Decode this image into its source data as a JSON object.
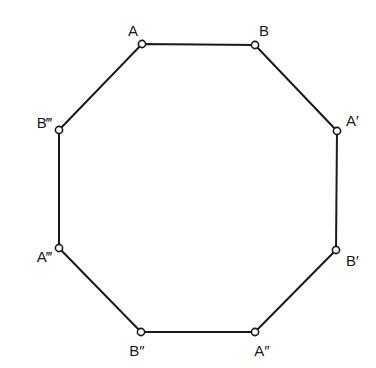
{
  "diagram": {
    "type": "octagon",
    "colors": {
      "stroke": "#1a1a1a",
      "background": "#ffffff",
      "vertex_fill": "#ffffff"
    },
    "vertices": [
      {
        "id": "A",
        "label": "A",
        "x": 142,
        "y": 44,
        "lx": 133,
        "ly": 36,
        "anchor": "middle"
      },
      {
        "id": "B",
        "label": "B",
        "x": 255,
        "y": 45,
        "lx": 264,
        "ly": 36,
        "anchor": "middle"
      },
      {
        "id": "A1",
        "label": "A′",
        "x": 337,
        "y": 131,
        "lx": 346,
        "ly": 126,
        "anchor": "start"
      },
      {
        "id": "B1",
        "label": "B′",
        "x": 336,
        "y": 250,
        "lx": 346,
        "ly": 266,
        "anchor": "start"
      },
      {
        "id": "A2",
        "label": "A″",
        "x": 255,
        "y": 332,
        "lx": 262,
        "ly": 356,
        "anchor": "middle"
      },
      {
        "id": "B2",
        "label": "B″",
        "x": 141,
        "y": 332,
        "lx": 137,
        "ly": 356,
        "anchor": "middle"
      },
      {
        "id": "A3",
        "label": "A‴",
        "x": 59,
        "y": 248,
        "lx": 52,
        "ly": 262,
        "anchor": "end"
      },
      {
        "id": "B3",
        "label": "B‴",
        "x": 59,
        "y": 130,
        "lx": 52,
        "ly": 128,
        "anchor": "end"
      }
    ]
  }
}
